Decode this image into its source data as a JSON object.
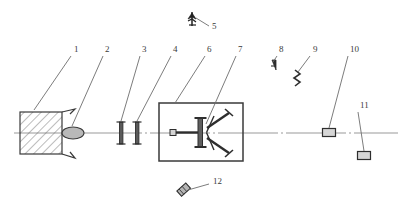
{
  "figure": {
    "type": "optical-schematic",
    "background_color": "#ffffff",
    "line_color": "#3a3a3a",
    "axis_color": "#8d8d8d",
    "hatch_color": "#6a6a6a"
  },
  "callouts": [
    {
      "id": "1",
      "label": "1",
      "label_x": 74,
      "label_y": 52,
      "leader_from": [
        71,
        56
      ],
      "leader_to": [
        34,
        110
      ],
      "target": "hatched-source-block"
    },
    {
      "id": "2",
      "label": "2",
      "label_x": 105,
      "label_y": 52,
      "leader_from": [
        103,
        56
      ],
      "leader_to": [
        72,
        126
      ],
      "target": "oval-lens"
    },
    {
      "id": "3",
      "label": "3",
      "label_x": 142,
      "label_y": 52,
      "leader_from": [
        140,
        56
      ],
      "leader_to": [
        121,
        124
      ],
      "target": "first-aperture"
    },
    {
      "id": "4",
      "label": "4",
      "label_x": 173,
      "label_y": 52,
      "leader_from": [
        171,
        56
      ],
      "leader_to": [
        137,
        124
      ],
      "target": "second-aperture"
    },
    {
      "id": "5",
      "label": "5",
      "label_x": 212,
      "label_y": 29,
      "leader_from": [
        209,
        26
      ],
      "leader_to": [
        196,
        18
      ],
      "target": "antenna-probe"
    },
    {
      "id": "6",
      "label": "6",
      "label_x": 207,
      "label_y": 52,
      "leader_from": [
        205,
        56
      ],
      "leader_to": [
        175,
        103
      ],
      "target": "enclosure-box"
    },
    {
      "id": "7",
      "label": "7",
      "label_x": 238,
      "label_y": 52,
      "leader_from": [
        236,
        56
      ],
      "leader_to": [
        205,
        124
      ],
      "target": "internal-mechanism"
    },
    {
      "id": "8",
      "label": "8",
      "label_x": 279,
      "label_y": 52,
      "leader_from": [
        277,
        56
      ],
      "leader_to": [
        272,
        64
      ],
      "target": "cone-detector"
    },
    {
      "id": "9",
      "label": "9",
      "label_x": 313,
      "label_y": 52,
      "leader_from": [
        310,
        56
      ],
      "leader_to": [
        296,
        74
      ],
      "target": "zigzag-element"
    },
    {
      "id": "10",
      "label": "10",
      "label_x": 350,
      "label_y": 52,
      "leader_from": [
        348,
        56
      ],
      "leader_to": [
        328,
        128
      ],
      "target": "axis-block-10"
    },
    {
      "id": "11",
      "label": "11",
      "label_x": 360,
      "label_y": 108,
      "leader_from": [
        358,
        112
      ],
      "leader_to": [
        364,
        152
      ],
      "target": "lower-block-11"
    },
    {
      "id": "12",
      "label": "12",
      "label_x": 213,
      "label_y": 184,
      "leader_from": [
        209,
        184
      ],
      "leader_to": [
        184,
        192
      ],
      "target": "angled-cylinder"
    }
  ],
  "components": {
    "optical_axis": {
      "y": 133,
      "x_start": 14,
      "x_end": 398
    },
    "source_block": {
      "x": 20,
      "y": 112,
      "width": 42,
      "height": 42,
      "hatched": true,
      "nozzle": true
    },
    "lens_oval": {
      "cx": 73,
      "cy": 133,
      "rx": 11,
      "ry": 6
    },
    "aperture_1": {
      "x": 121,
      "y": 122,
      "height": 22
    },
    "aperture_2": {
      "x": 137,
      "y": 122,
      "height": 22
    },
    "enclosure": {
      "x": 159,
      "y": 103,
      "width": 84,
      "height": 58
    },
    "mechanism": {
      "rod_start_x": 171,
      "hub_x": 203,
      "arm_count": 2
    },
    "block_10": {
      "x": 323,
      "y": 128,
      "width": 13,
      "height": 8
    },
    "block_11": {
      "x": 358,
      "y": 152,
      "width": 13,
      "height": 8
    },
    "cylinder_12": {
      "x": 180,
      "y": 188,
      "angle": -40
    }
  }
}
